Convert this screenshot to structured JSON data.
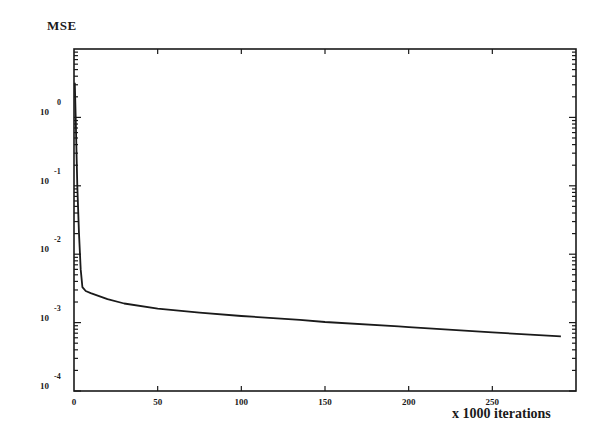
{
  "chart_data": {
    "type": "line",
    "title": "",
    "ylabel": "MSE",
    "xlabel": "x 1000 iterations",
    "yscale": "log",
    "xlim": [
      0,
      300
    ],
    "ylim": [
      0.0001,
      10
    ],
    "grid": false,
    "legend": null,
    "xticks": [
      0,
      50,
      100,
      150,
      200,
      250
    ],
    "xtick_labels": [
      "0",
      "50",
      "100",
      "150",
      "200",
      "250"
    ],
    "yticks": [
      1,
      0.1,
      0.01,
      0.001,
      0.0001
    ],
    "ytick_labels": [
      {
        "base": "10",
        "exp": "0"
      },
      {
        "base": "10",
        "exp": "-1"
      },
      {
        "base": "10",
        "exp": "-2"
      },
      {
        "base": "10",
        "exp": "-3"
      },
      {
        "base": "10",
        "exp": "-4"
      }
    ],
    "series": [
      {
        "name": "MSE",
        "color": "#1a1a1a",
        "x": [
          0.5,
          1,
          2,
          3,
          4,
          5,
          7,
          10,
          20,
          30,
          50,
          75,
          100,
          135,
          150,
          194,
          200,
          250,
          291
        ],
        "y": [
          3.2,
          1.0,
          0.1,
          0.02,
          0.006,
          0.0033,
          0.0029,
          0.0027,
          0.0022,
          0.0019,
          0.0016,
          0.0014,
          0.00125,
          0.0011,
          0.00102,
          0.00088,
          0.00086,
          0.00072,
          0.00063
        ]
      }
    ]
  },
  "labels": {
    "y_axis": "MSE",
    "x_axis": "x 1000 iterations"
  }
}
